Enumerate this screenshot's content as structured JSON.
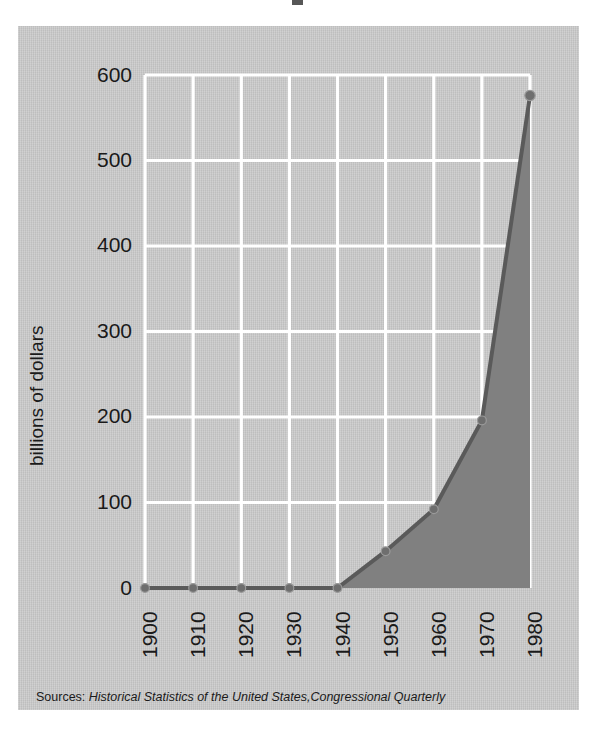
{
  "figure": {
    "background_color": "#ffffff",
    "panel_color": "#c9c9c9",
    "gridline_color": "#ffffff",
    "series_fill_color": "#808080",
    "series_line_color": "#5a5a5a",
    "text_color": "#1a1a1a"
  },
  "source_note": {
    "label": "Sources: ",
    "italic_text": "Historical Statistics of the United States,Congressional Quarterly",
    "full_text": "Sources: Historical Statistics of the United States,Congressional Quarterly"
  },
  "chart_data": {
    "type": "area",
    "title": "",
    "xlabel": "",
    "ylabel": "billions of dollars",
    "x": [
      1900,
      1910,
      1920,
      1930,
      1940,
      1950,
      1960,
      1970,
      1980
    ],
    "categories": [
      "1900",
      "1910",
      "1920",
      "1930",
      "1940",
      "1950",
      "1960",
      "1970",
      "1980"
    ],
    "values": [
      0,
      0,
      0,
      0,
      0,
      43,
      92,
      196,
      576
    ],
    "series": [
      {
        "name": "federal spending",
        "values": [
          0,
          0,
          0,
          0,
          0,
          43,
          92,
          196,
          576
        ]
      }
    ],
    "xlim": [
      1900,
      1980
    ],
    "ylim": [
      0,
      600
    ],
    "ytick_labels": [
      "0",
      "100",
      "200",
      "300",
      "400",
      "500",
      "600"
    ],
    "yticks": [
      0,
      100,
      200,
      300,
      400,
      500,
      600
    ],
    "xtick_labels": [
      "1900",
      "1910",
      "1920",
      "1930",
      "1940",
      "1950",
      "1960",
      "1970",
      "1980"
    ],
    "xticks": [
      1900,
      1910,
      1920,
      1930,
      1940,
      1950,
      1960,
      1970,
      1980
    ],
    "grid": true,
    "legend": "none",
    "markers": true,
    "annotations": []
  }
}
